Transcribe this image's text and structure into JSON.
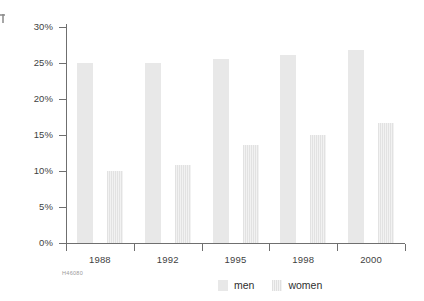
{
  "chart_data": {
    "type": "bar",
    "title": "",
    "subtitle": "",
    "xlabel": "",
    "ylabel": "",
    "categories": [
      "1988",
      "1992",
      "1995",
      "1998",
      "2000"
    ],
    "series": [
      {
        "name": "men",
        "values": [
          25.0,
          25.0,
          25.6,
          26.1,
          26.8
        ]
      },
      {
        "name": "women",
        "values": [
          10.0,
          10.8,
          13.6,
          15.0,
          16.6
        ]
      }
    ],
    "ylim": [
      0,
      30
    ],
    "ytick_labels": [
      "0%",
      "5%",
      "10%",
      "15%",
      "20%",
      "25%",
      "30%"
    ],
    "ytick_values": [
      0,
      5,
      10,
      15,
      20,
      25,
      30
    ],
    "grid": false,
    "legend_position": "bottom-center",
    "value_unit": "%",
    "colors": {
      "men": "#e8e8e8",
      "women": "#ececec",
      "axis": "#6f6f6f",
      "text": "#3f3f3f"
    }
  },
  "legend": {
    "items": [
      {
        "label": "men",
        "key": "men"
      },
      {
        "label": "women",
        "key": "women"
      }
    ]
  },
  "footer": {
    "source_code": "H46080"
  }
}
